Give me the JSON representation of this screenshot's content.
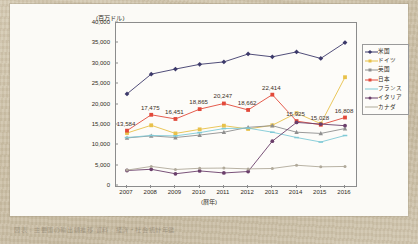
{
  "figure": {
    "unit_label": "(百万ドル)",
    "x_title": "(暦年)",
    "caption": "図表 : 主要国の輸出額推移   資料 : 経済・社会統計年鑑"
  },
  "legend": {
    "position": "right",
    "items": [
      {
        "label": "米国",
        "color": "#3d3a6b",
        "marker": "diamond"
      },
      {
        "label": "ドイツ",
        "color": "#e8c14a",
        "marker": "square"
      },
      {
        "label": "英国",
        "color": "#8f8f8f",
        "marker": "triangle"
      },
      {
        "label": "日本",
        "color": "#e2493a",
        "marker": "square"
      },
      {
        "label": "フランス",
        "color": "#7fc9d6",
        "marker": "dash"
      },
      {
        "label": "イタリア",
        "color": "#6b3f6b",
        "marker": "circle"
      },
      {
        "label": "カナダ",
        "color": "#b0a99a",
        "marker": "line"
      }
    ]
  },
  "chart_data": {
    "type": "line",
    "title": "",
    "xlabel": "(暦年)",
    "ylabel": "(百万ドル)",
    "xlim": [
      2007,
      2016
    ],
    "ylim": [
      0,
      40000
    ],
    "ytick_values": [
      0,
      5000,
      10000,
      15000,
      20000,
      25000,
      30000,
      35000,
      40000
    ],
    "ytick_labels": [
      "0",
      "5,000",
      "10,000",
      "15,000",
      "20,000",
      "25,000",
      "30,000",
      "35,000",
      "40,000"
    ],
    "grid": false,
    "categories": [
      2007,
      2008,
      2009,
      2010,
      2011,
      2012,
      2013,
      2014,
      2015,
      2016
    ],
    "xtick_labels": [
      "2007",
      "2008",
      "2009",
      "2010",
      "2011",
      "2012",
      "2013",
      "2014",
      "2015",
      "2016"
    ],
    "series": [
      {
        "name": "米国",
        "color": "#3d3a6b",
        "marker": "diamond",
        "values": [
          22600,
          27450,
          28700,
          29850,
          30450,
          32400,
          31700,
          32900,
          31300,
          35200
        ]
      },
      {
        "name": "ドイツ",
        "color": "#e8c14a",
        "marker": "square",
        "values": [
          13000,
          14900,
          12900,
          13900,
          14800,
          14000,
          14900,
          17900,
          15300,
          26700
        ]
      },
      {
        "name": "英国",
        "color": "#8f8f8f",
        "marker": "triangle",
        "values": [
          11800,
          12300,
          11900,
          12500,
          13200,
          14400,
          14800,
          13200,
          12900,
          14100
        ]
      },
      {
        "name": "日本",
        "color": "#e2493a",
        "marker": "square",
        "values": [
          13584,
          17475,
          16451,
          18865,
          20247,
          18662,
          22414,
          15925,
          15028,
          16808
        ],
        "labels": [
          "13,584",
          "17,475",
          "16,451",
          "18,865",
          "20,247",
          "18,662",
          "22,414",
          "15,925",
          "15,028",
          "16,808"
        ]
      },
      {
        "name": "フランス",
        "color": "#7fc9d6",
        "marker": "dash",
        "values": [
          11900,
          12400,
          12300,
          13100,
          14100,
          14200,
          13200,
          11900,
          10800,
          12400
        ]
      },
      {
        "name": "イタリア",
        "color": "#6b3f6b",
        "marker": "circle",
        "values": [
          3800,
          4100,
          3000,
          3700,
          3200,
          3550,
          11000,
          15600,
          15200,
          14800
        ]
      },
      {
        "name": "カナダ",
        "color": "#b0a99a",
        "marker": "line",
        "values": [
          3900,
          4800,
          4050,
          4350,
          4400,
          4200,
          4300,
          5100,
          4700,
          4800
        ]
      }
    ],
    "annotated_series": "日本"
  }
}
